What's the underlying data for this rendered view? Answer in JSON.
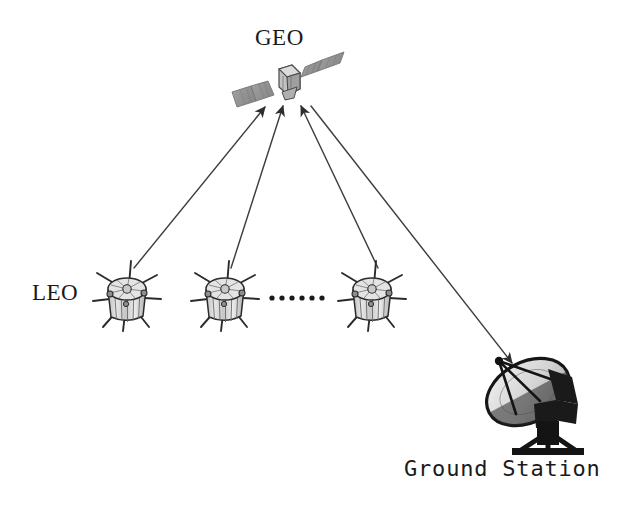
{
  "figure": {
    "type": "diagram",
    "background_color": "#ffffff",
    "line_color": "#3a3a3a",
    "text_color": "#1a1a1a"
  },
  "labels": {
    "geo": "GEO",
    "leo": "LEO",
    "ground_station": "Ground Station",
    "ellipsis": "· · · · · ·"
  },
  "nodes": {
    "geo_satellite": {
      "name": "GEO",
      "center_x": 288,
      "center_y": 83,
      "body_fill": "#b5b5b5",
      "panel_fill": "#9a9a9a",
      "panel_count": 2
    },
    "leo_satellites": [
      {
        "name": "LEO-1",
        "center_x": 127,
        "center_y": 295,
        "boom_count": 8,
        "body_fill": "#d0d0d0"
      },
      {
        "name": "LEO-2",
        "center_x": 225,
        "center_y": 295,
        "boom_count": 8,
        "body_fill": "#d0d0d0"
      },
      {
        "name": "LEO-3",
        "center_x": 372,
        "center_y": 295,
        "boom_count": 8,
        "body_fill": "#d0d0d0"
      }
    ],
    "ellipsis_dots": {
      "count": 6,
      "x_start": 272,
      "x_step": 10,
      "y": 298,
      "radius": 2.6,
      "fill": "#1a1a1a"
    },
    "ground_station": {
      "name": "Ground Station",
      "dish_center_x": 528,
      "dish_center_y": 392,
      "dish_fill": "#d8d8d8",
      "structure_fill": "#1f1f1f"
    }
  },
  "links": [
    {
      "name": "leo1-to-geo",
      "from": "LEO-1",
      "to": "GEO",
      "arrow": "to-geo"
    },
    {
      "name": "leo2-to-geo",
      "from": "LEO-2",
      "to": "GEO",
      "arrow": "to-geo"
    },
    {
      "name": "leo3-to-geo",
      "from": "LEO-3",
      "to": "GEO",
      "arrow": "to-geo"
    },
    {
      "name": "geo-to-ground",
      "from": "GEO",
      "to": "Ground Station",
      "arrow": "to-ground"
    }
  ]
}
